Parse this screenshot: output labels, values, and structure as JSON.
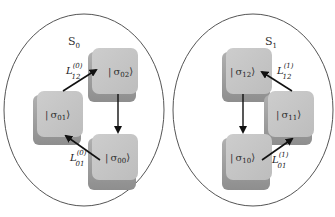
{
  "diagram": {
    "sets": [
      {
        "label": "S",
        "label_sub": "0",
        "states": [
          {
            "id": "s01",
            "ket_left": "|",
            "sigma": "σ",
            "sub": "01",
            "ket_right": "⟩"
          },
          {
            "id": "s02",
            "ket_left": "|",
            "sigma": "σ",
            "sub": "02",
            "ket_right": "⟩"
          },
          {
            "id": "s00",
            "ket_left": "|",
            "sigma": "σ",
            "sub": "00",
            "ket_right": "⟩"
          }
        ],
        "transitions": [
          {
            "from": "s01",
            "to": "s02",
            "label": "L",
            "sub": "12",
            "sup": "(0)"
          },
          {
            "from": "s02",
            "to": "s00",
            "label": "",
            "sub": "",
            "sup": ""
          },
          {
            "from": "s00",
            "to": "s01",
            "label": "L",
            "sub": "01",
            "sup": "(0)"
          }
        ]
      },
      {
        "label": "S",
        "label_sub": "1",
        "states": [
          {
            "id": "s12",
            "ket_left": "|",
            "sigma": "σ",
            "sub": "12",
            "ket_right": "⟩"
          },
          {
            "id": "s11",
            "ket_left": "|",
            "sigma": "σ",
            "sub": "11",
            "ket_right": "⟩"
          },
          {
            "id": "s10",
            "ket_left": "|",
            "sigma": "σ",
            "sub": "10",
            "ket_right": "⟩"
          }
        ],
        "transitions": [
          {
            "from": "s11",
            "to": "s12",
            "label": "L",
            "sub": "12",
            "sup": "(1)"
          },
          {
            "from": "s12",
            "to": "s10",
            "label": "",
            "sub": "",
            "sup": ""
          },
          {
            "from": "s10",
            "to": "s11",
            "label": "L",
            "sub": "01",
            "sup": "(1)"
          }
        ]
      }
    ],
    "colors": {
      "cube_face": "#c4c4c4",
      "cube_shadow": "#9e9e9e",
      "ellipse_stroke": "#555555",
      "arrow": "#111111"
    }
  }
}
